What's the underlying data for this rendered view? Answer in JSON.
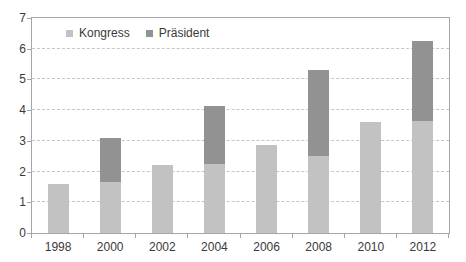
{
  "chart_data": {
    "type": "bar",
    "stacked": true,
    "title": "",
    "xlabel": "",
    "ylabel": "",
    "categories": [
      "1998",
      "2000",
      "2002",
      "2004",
      "2006",
      "2008",
      "2010",
      "2012"
    ],
    "series": [
      {
        "name": "Kongress",
        "key": "kongress",
        "color": "#c2c2c2",
        "values": [
          1.6,
          1.65,
          2.2,
          2.25,
          2.85,
          2.5,
          3.6,
          3.65
        ]
      },
      {
        "name": "Präsident",
        "key": "praesident",
        "color": "#929292",
        "values": [
          0,
          1.45,
          0,
          1.9,
          0,
          2.8,
          0,
          2.6
        ]
      }
    ],
    "totals": [
      1.6,
      3.1,
      2.2,
      4.15,
      2.85,
      5.3,
      3.6,
      6.25
    ],
    "ylim": [
      0,
      7
    ],
    "ytick_labels": [
      "0",
      "1",
      "2",
      "3",
      "4",
      "5",
      "6",
      "7"
    ],
    "grid": "horizontal-dashed",
    "legend_position": "top-left-inside",
    "plot_border_color": "#a6a6a6",
    "gridline_color": "#c6c6c6",
    "text_color": "#3a3a3a",
    "background_color": "#ffffff"
  }
}
